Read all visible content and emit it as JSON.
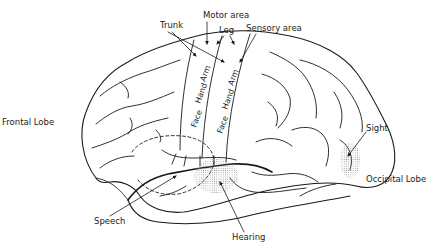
{
  "diagram": {
    "labels": {
      "trunk": "Trunk",
      "motor_area": "Motor area",
      "leg": "Leg",
      "sensory_area": "Sensory area",
      "frontal_lobe": "Frontal Lobe",
      "sight": "Sight",
      "occipital_lobe": "Occipital Lobe",
      "speech": "Speech",
      "hearing": "Hearing"
    },
    "motor_strip": {
      "face": "Face",
      "hand": "Hand",
      "arm": "Arm"
    },
    "sensory_strip": {
      "face": "Face",
      "hand": "Hand",
      "arm": "Arm"
    },
    "colors": {
      "line": "#1a1a1a",
      "stipple": "#bdbdbd",
      "background": "#ffffff"
    }
  }
}
